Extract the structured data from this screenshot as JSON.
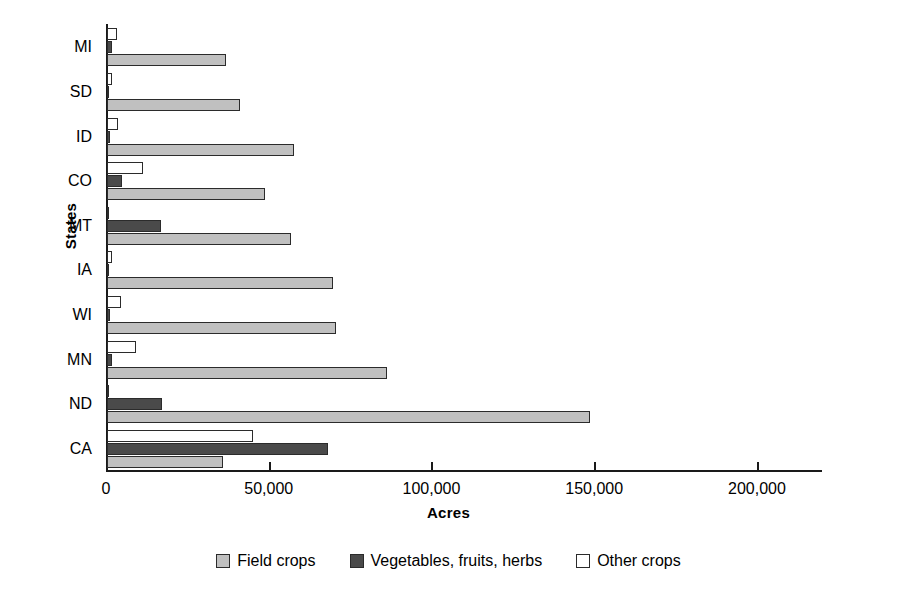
{
  "chart_data": {
    "type": "bar",
    "orientation": "horizontal",
    "title": "",
    "xlabel": "Acres",
    "ylabel": "States",
    "xlim": [
      0,
      220000
    ],
    "xticks": [
      0,
      50000,
      100000,
      150000,
      200000
    ],
    "xtick_labels": [
      "0",
      "50,000",
      "100,000",
      "150,000",
      "200,000"
    ],
    "grid": false,
    "legend_position": "bottom",
    "categories": [
      "MI",
      "SD",
      "ID",
      "CO",
      "MT",
      "IA",
      "WI",
      "MN",
      "ND",
      "CA"
    ],
    "series": [
      {
        "name": "Field crops",
        "color": "#c0c0c0",
        "values": [
          36500,
          41000,
          57500,
          48500,
          56500,
          69500,
          70500,
          86000,
          148500,
          35500
        ]
      },
      {
        "name": "Vegetables, fruits, herbs",
        "color": "#4a4a4a",
        "values": [
          1500,
          400,
          1000,
          4500,
          16500,
          300,
          1000,
          1500,
          17000,
          68000
        ]
      },
      {
        "name": "Other crops",
        "color": "#ffffff",
        "values": [
          3000,
          1500,
          3500,
          11000,
          300,
          1500,
          4300,
          9000,
          300,
          45000
        ]
      }
    ]
  },
  "legend": {
    "items": [
      {
        "label": "Field crops",
        "color": "#c0c0c0"
      },
      {
        "label": "Vegetables, fruits, herbs",
        "color": "#4a4a4a"
      },
      {
        "label": "Other crops",
        "color": "#ffffff"
      }
    ]
  }
}
